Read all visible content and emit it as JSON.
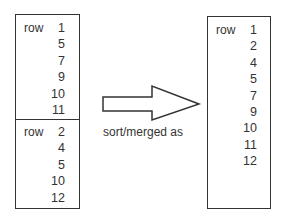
{
  "left_box": {
    "top_section": {
      "label": "row",
      "values": [
        "1",
        "5",
        "7",
        "9",
        "10",
        "11"
      ]
    },
    "bottom_section": {
      "label": "row",
      "values": [
        "2",
        "4",
        "5",
        "10",
        "12"
      ]
    }
  },
  "arrow": {
    "caption": "sort/merged as"
  },
  "right_box": {
    "label": "row",
    "values": [
      "1",
      "2",
      "4",
      "5",
      "7",
      "9",
      "10",
      "11",
      "12"
    ]
  }
}
